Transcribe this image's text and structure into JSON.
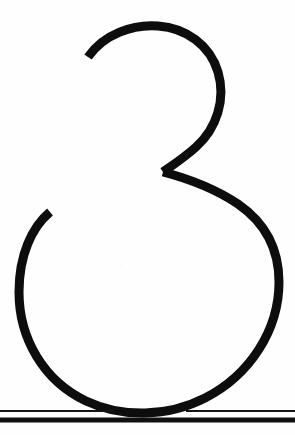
{
  "page": {
    "background_color": "#fefefe",
    "width": 295,
    "height": 435
  },
  "glyph": {
    "character": "3",
    "name": "digit-three",
    "description": "Large open-tailed numeral three drawn as a monoline stroke with a small upper bowl and a large lower bowl meeting at a sharp leftward wedge",
    "ink_color": "#0d0d0d",
    "stroke_width": 9,
    "bounds": {
      "left": 18,
      "top": 24,
      "right": 281,
      "bottom": 412
    },
    "upper_bowl": {
      "apex_x": 150,
      "apex_y": 25,
      "right_extent_x": 222,
      "terminal_x": 88,
      "terminal_y": 57
    },
    "junction": {
      "x": 163,
      "y": 172
    },
    "lower_bowl": {
      "left_extent_x": 19,
      "right_extent_x": 279,
      "bottom_y": 411,
      "terminal_x": 50,
      "terminal_y": 212
    }
  },
  "rules": [
    {
      "name": "baseline-hairline-rule",
      "kind": "thin",
      "y": 411,
      "thickness": 2,
      "color": "#151515",
      "interrupted": true,
      "gap_start_x": 114,
      "gap_end_x": 186
    },
    {
      "name": "baseline-heavy-rule",
      "kind": "thick",
      "y": 420,
      "thickness": 5,
      "color": "#101010",
      "interrupted": false
    }
  ]
}
